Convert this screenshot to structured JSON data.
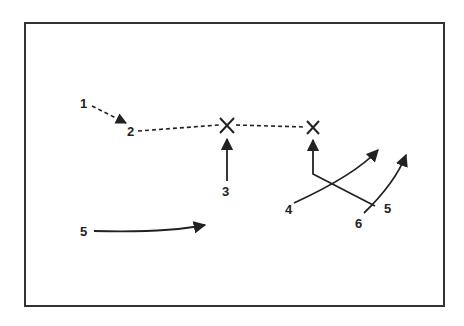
{
  "diagram": {
    "type": "play-diagram",
    "frame": {
      "x": 25,
      "y": 23,
      "width": 419,
      "height": 283,
      "stroke": "#333333"
    },
    "labels": [
      {
        "id": "label-1",
        "text": "1",
        "x": 80,
        "y": 108
      },
      {
        "id": "label-2",
        "text": "2",
        "x": 127,
        "y": 135
      },
      {
        "id": "label-3",
        "text": "3",
        "x": 222,
        "y": 196
      },
      {
        "id": "label-4",
        "text": "4",
        "x": 285,
        "y": 214
      },
      {
        "id": "label-5-right",
        "text": "5",
        "x": 385,
        "y": 214
      },
      {
        "id": "label-6",
        "text": "6",
        "x": 355,
        "y": 228
      },
      {
        "id": "label-5-left",
        "text": "5",
        "x": 80,
        "y": 236
      }
    ],
    "markers": [
      {
        "id": "x-marker-1",
        "symbol": "X",
        "x": 227,
        "y": 125
      },
      {
        "id": "x-marker-2",
        "symbol": "X",
        "x": 313,
        "y": 127
      }
    ]
  }
}
